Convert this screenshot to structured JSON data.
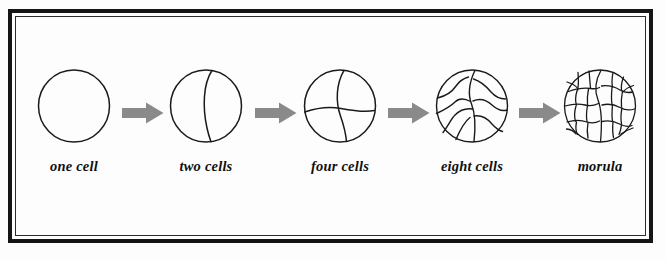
{
  "figure": {
    "border_color": "#151515",
    "background_color": "#fdfdfd",
    "arrow_color": "#8a8a8a",
    "outline_color": "#1a1a1a"
  },
  "stages": [
    {
      "id": "one-cell",
      "label": "one cell",
      "cell_count": 1,
      "description": "single undivided zygote, plain circle outline"
    },
    {
      "id": "two-cell",
      "label": "two cells",
      "cell_count": 2,
      "description": "circle with one curved vertical cleavage furrow right of center"
    },
    {
      "id": "four-cell",
      "label": "four cells",
      "cell_count": 4,
      "description": "circle with crossing curved vertical and horizontal furrows"
    },
    {
      "id": "eight-cell",
      "label": "eight cells",
      "cell_count": 8,
      "description": "circle divided into eight irregular wavy blastomeres"
    },
    {
      "id": "morula",
      "label": "morula",
      "cell_count": 24,
      "description": "solid ball of many small irregular polygonal blastomeres"
    }
  ],
  "arrows": [
    {
      "id": "arrow-one-to-two",
      "from": "one cell",
      "to": "two cells"
    },
    {
      "id": "arrow-two-to-four",
      "from": "two cells",
      "to": "four cells"
    },
    {
      "id": "arrow-four-to-eight",
      "from": "four cells",
      "to": "eight cells"
    },
    {
      "id": "arrow-eight-to-morula",
      "from": "eight cells",
      "to": "morula"
    }
  ]
}
